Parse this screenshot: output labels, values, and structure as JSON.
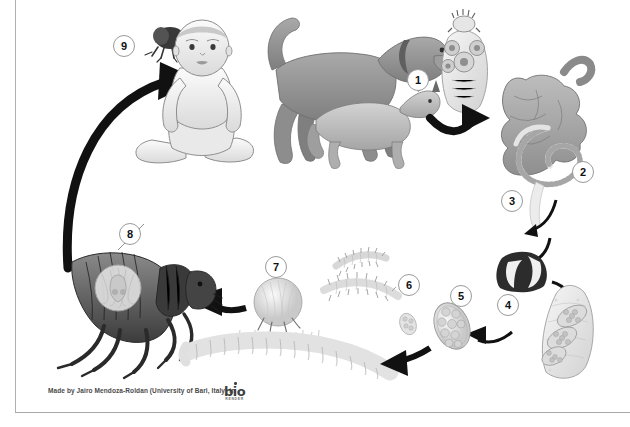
{
  "diagram": {
    "background_color": "#ffffff",
    "line_color": "#a8a8a8"
  },
  "steps": [
    {
      "number": "1",
      "label": "scolex-attaches-to-intestine",
      "x": 418,
      "y": 80
    },
    {
      "number": "2",
      "label": "adult-tapeworm-in-small-intestine",
      "x": 583,
      "y": 172
    },
    {
      "number": "3",
      "label": "gravid-proglottids-released-in-feces",
      "x": 512,
      "y": 201
    },
    {
      "number": "4",
      "label": "gravid-proglottid-with-egg-packets",
      "x": 508,
      "y": 305
    },
    {
      "number": "5",
      "label": "egg-packet-ingested-by-flea-larva",
      "x": 461,
      "y": 296
    },
    {
      "number": "6",
      "label": "flea-larva",
      "x": 409,
      "y": 285
    },
    {
      "number": "7",
      "label": "flea-pupa-cocoon",
      "x": 276,
      "y": 267
    },
    {
      "number": "8",
      "label": "adult-flea-with-cysticercoid",
      "x": 130,
      "y": 234
    },
    {
      "number": "9",
      "label": "infected-flea-ingested-by-host",
      "x": 124,
      "y": 46
    }
  ],
  "organisms": [
    {
      "name": "child-host",
      "caption": "Child (accidental host)"
    },
    {
      "name": "dog-host",
      "caption": "Dog (definitive host)"
    },
    {
      "name": "cat-host",
      "caption": "Cat (definitive host)"
    },
    {
      "name": "tapeworm-scolex",
      "caption": "Tapeworm scolex with suckers and rostellum"
    },
    {
      "name": "small-intestine",
      "caption": "Small intestine containing adult tapeworm"
    },
    {
      "name": "proglottid-chain",
      "caption": "Proglottid shed from strobila"
    },
    {
      "name": "feces",
      "caption": "Feces containing gravid proglottids"
    },
    {
      "name": "gravid-proglottid",
      "caption": "Gravid proglottid with egg capsules"
    },
    {
      "name": "egg-packet",
      "caption": "Egg packet"
    },
    {
      "name": "flea-larva",
      "caption": "Flea larva"
    },
    {
      "name": "flea-pupa",
      "caption": "Flea pupa in cocoon"
    },
    {
      "name": "adult-flea",
      "caption": "Adult flea harbouring cysticercoid"
    },
    {
      "name": "adult-tapeworm",
      "caption": "Adult segmented tapeworm"
    },
    {
      "name": "flea-small",
      "caption": "Flea transferring to host"
    }
  ],
  "credit": {
    "text": "Made by Jairo Mendoza-Roldan (University of Bari, Italy) in",
    "logo_main": "bio",
    "logo_sub": "RENDER"
  }
}
